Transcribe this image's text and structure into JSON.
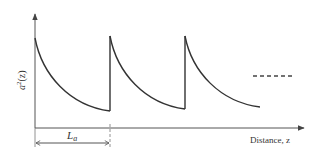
{
  "diagram": {
    "type": "sawtooth-decay-plot",
    "y_axis_label": {
      "base": "a",
      "superscript": "2",
      "suffix": "(z)"
    },
    "x_axis_label": "Distance, z",
    "period_label": {
      "base": "L",
      "subscript": "a"
    },
    "continuation": "dashed-line",
    "colors": {
      "line": "#333333",
      "axis": "#555555",
      "background": "#ffffff"
    },
    "segments": [
      {
        "start_x": 35,
        "end_x": 110,
        "peak_y": 38,
        "trough_y": 111
      },
      {
        "start_x": 110,
        "end_x": 185,
        "peak_y": 36,
        "trough_y": 109
      },
      {
        "start_x": 185,
        "end_x": 260,
        "peak_y": 36,
        "trough_y": 107
      }
    ]
  }
}
